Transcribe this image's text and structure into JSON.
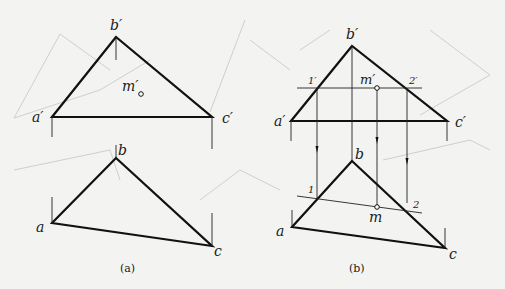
{
  "figure": {
    "panel_a": {
      "caption": "(a)",
      "front_view": {
        "labels": {
          "b": "b′",
          "a": "a′",
          "c": "c′",
          "m": "m′"
        }
      },
      "top_view": {
        "labels": {
          "b": "b",
          "a": "a",
          "c": "c"
        }
      }
    },
    "panel_b": {
      "caption": "(b)",
      "front_view": {
        "labels": {
          "b": "b′",
          "a": "a′",
          "c": "c′",
          "m": "m′",
          "p1": "1′",
          "p2": "2′"
        }
      },
      "top_view": {
        "labels": {
          "b": "b",
          "a": "a",
          "c": "c",
          "m": "m",
          "p1": "1",
          "p2": "2"
        }
      }
    },
    "colors": {
      "background": "#f3f3f1",
      "line": "#111111",
      "ghost_lines": "#cfcfcb"
    }
  }
}
